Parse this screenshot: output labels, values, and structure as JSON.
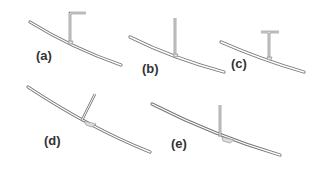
{
  "figure": {
    "panels": [
      {
        "id": "a",
        "label": "(a)",
        "post_shape": "post with hook"
      },
      {
        "id": "b",
        "label": "(b)",
        "post_shape": "straight post"
      },
      {
        "id": "c",
        "label": "(c)",
        "post_shape": "T-shaped post"
      },
      {
        "id": "d",
        "label": "(d)",
        "post_shape": "slanted post"
      },
      {
        "id": "e",
        "label": "(e)",
        "post_shape": "straight post with weld"
      }
    ]
  }
}
